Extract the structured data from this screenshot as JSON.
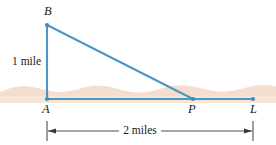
{
  "figure": {
    "background_color": "#ffffff",
    "line_color": "#4d97c4",
    "terrain_color": "#f7e3d6",
    "dimension_color": "#3a3a3a",
    "text_color": "#1a1a1a",
    "points": {
      "B": {
        "label": "B",
        "x": 47,
        "y": 25
      },
      "A": {
        "label": "A",
        "x": 47,
        "y": 99
      },
      "P": {
        "label": "P",
        "x": 193,
        "y": 99
      },
      "L": {
        "label": "L",
        "x": 253,
        "y": 99
      }
    },
    "segments": [
      {
        "name": "vertical-AB",
        "from": "A",
        "to": "B"
      },
      {
        "name": "hypotenuse-BP",
        "from": "B",
        "to": "P"
      },
      {
        "name": "baseline-AL",
        "from": "A",
        "to": "L"
      }
    ],
    "annotations": {
      "vertical_length": "1 mile",
      "horizontal_length": "2 miles"
    },
    "dimension": {
      "label": "2 miles",
      "start_x": 47,
      "end_x": 253,
      "y": 131
    }
  }
}
